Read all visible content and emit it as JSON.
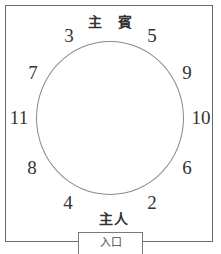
{
  "diagram": {
    "labels": {
      "guest_of_honor": "主 賓",
      "host": "主人",
      "entrance": "入口"
    },
    "seats": [
      {
        "number": "3",
        "x": 69,
        "y": 35
      },
      {
        "number": "5",
        "x": 152,
        "y": 35
      },
      {
        "number": "7",
        "x": 33,
        "y": 72
      },
      {
        "number": "9",
        "x": 187,
        "y": 72
      },
      {
        "number": "11",
        "x": 19,
        "y": 117
      },
      {
        "number": "10",
        "x": 201,
        "y": 117
      },
      {
        "number": "8",
        "x": 32,
        "y": 167
      },
      {
        "number": "6",
        "x": 187,
        "y": 167
      },
      {
        "number": "4",
        "x": 68,
        "y": 202
      },
      {
        "number": "2",
        "x": 152,
        "y": 202
      }
    ]
  }
}
